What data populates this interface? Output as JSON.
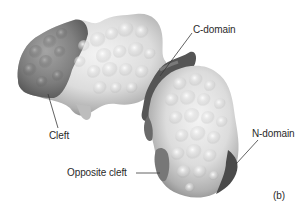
{
  "figure": {
    "panel_label": "(b)",
    "colors": {
      "background": "#ffffff",
      "light_surface": "#e6e6e6",
      "mid_surface": "#a8a8a8",
      "dark_surface": "#5a5a5a",
      "label_text": "#2a2a2a",
      "leader_line": "#3a3a3a"
    },
    "labels": [
      {
        "id": "c-domain",
        "text": "C-domain"
      },
      {
        "id": "cleft",
        "text": "Cleft"
      },
      {
        "id": "n-domain",
        "text": "N-domain"
      },
      {
        "id": "opposite-cleft",
        "text": "Opposite cleft"
      }
    ]
  }
}
